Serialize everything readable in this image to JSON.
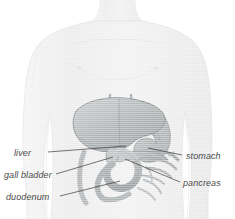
{
  "figure": {
    "type": "anatomical-illustration",
    "view": "anterior",
    "width": 235,
    "height": 219,
    "background_color": "#ffffff",
    "body_outline_color": "#e8e8e8",
    "organ_fill_color": "#b9bcbd",
    "organ_stroke_color": "#8f9294",
    "leader_line_color": "#3b3b3b",
    "label_text_color": "#4a4a4a"
  },
  "labels": {
    "liver": "liver",
    "gall_bladder": "gall bladder",
    "duodenum": "duodenum",
    "stomach": "stomach",
    "pancreas": "pancreas"
  },
  "annotations": [
    {
      "id": "liver",
      "text": "liver",
      "side": "left",
      "label_x": 14,
      "label_y": 153,
      "line_from_x": 48,
      "line_from_y": 152,
      "line_to_x": 126,
      "line_to_y": 146
    },
    {
      "id": "gall-bladder",
      "text": "gall bladder",
      "side": "left",
      "label_x": 4,
      "label_y": 175,
      "line_from_x": 56,
      "line_from_y": 174,
      "line_to_x": 113,
      "line_to_y": 157
    },
    {
      "id": "duodenum",
      "text": "duodenum",
      "side": "left",
      "label_x": 6,
      "label_y": 197,
      "line_from_x": 60,
      "line_from_y": 196,
      "line_to_x": 120,
      "line_to_y": 181
    },
    {
      "id": "stomach",
      "text": "stomach",
      "side": "right",
      "label_x": 186,
      "label_y": 156,
      "line_from_x": 182,
      "line_from_y": 155,
      "line_to_x": 148,
      "line_to_y": 148
    },
    {
      "id": "pancreas",
      "text": "pancreas",
      "side": "right",
      "label_x": 183,
      "label_y": 183,
      "line_from_x": 180,
      "line_from_y": 182,
      "line_to_x": 125,
      "line_to_y": 159
    }
  ]
}
